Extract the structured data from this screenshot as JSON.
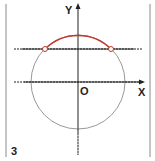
{
  "figure": {
    "panel_number": "3",
    "axis_labels": {
      "x": "X",
      "y": "Y",
      "origin": "O"
    },
    "colors": {
      "arc": "#c0392b",
      "circle": "#999999",
      "axes": "#222222",
      "frame": "#888888",
      "points": "#c0392b"
    }
  }
}
